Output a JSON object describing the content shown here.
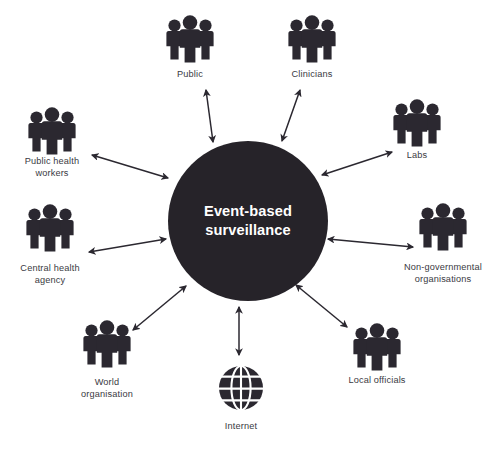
{
  "diagram": {
    "type": "hub-and-spoke",
    "hub": {
      "label_line1": "Event-based",
      "label_line2": "surveillance",
      "fill_color": "#262329",
      "text_color": "#ffffff",
      "cx": 248,
      "cy": 221,
      "r": 80
    },
    "connector_style": {
      "color": "#2b2830",
      "arrowheads": "both",
      "direction": "bidirectional"
    },
    "label_color": "#3a3a3f",
    "nodes": [
      {
        "id": "public",
        "label_lines": [
          "Public"
        ],
        "icon": "people-group-icon",
        "icon_cx": 190,
        "icon_cy": 40,
        "label_x": 190,
        "label_y": 77,
        "spoke_from": [
          206,
          90
        ],
        "spoke_to": [
          213,
          142
        ]
      },
      {
        "id": "clinicians",
        "label_lines": [
          "Clinicians"
        ],
        "icon": "people-group-icon",
        "icon_cx": 312,
        "icon_cy": 40,
        "label_x": 312,
        "label_y": 77,
        "spoke_from": [
          300,
          90
        ],
        "spoke_to": [
          282,
          141
        ]
      },
      {
        "id": "labs",
        "label_lines": [
          "Labs"
        ],
        "icon": "people-group-icon",
        "icon_cx": 417,
        "icon_cy": 124,
        "label_x": 417,
        "label_y": 158,
        "spoke_from": [
          392,
          152
        ],
        "spoke_to": [
          322,
          175
        ]
      },
      {
        "id": "ngo",
        "label_lines": [
          "Non-governmental",
          "organisations"
        ],
        "icon": "people-group-icon",
        "icon_cx": 443,
        "icon_cy": 228,
        "label_x": 443,
        "label_y": 270,
        "spoke_from": [
          413,
          247
        ],
        "spoke_to": [
          328,
          239
        ]
      },
      {
        "id": "local-officials",
        "label_lines": [
          "Local officials"
        ],
        "icon": "people-group-icon",
        "icon_cx": 377,
        "icon_cy": 348,
        "label_x": 377,
        "label_y": 383,
        "spoke_from": [
          347,
          327
        ],
        "spoke_to": [
          296,
          285
        ]
      },
      {
        "id": "internet",
        "label_lines": [
          "Internet"
        ],
        "icon": "globe-icon",
        "icon_cx": 241,
        "icon_cy": 388,
        "label_x": 241,
        "label_y": 429,
        "spoke_from": [
          239,
          355
        ],
        "spoke_to": [
          239,
          307
        ]
      },
      {
        "id": "world-organisation",
        "label_lines": [
          "World",
          "organisation"
        ],
        "icon": "people-group-icon",
        "icon_cx": 107,
        "icon_cy": 345,
        "label_x": 107,
        "label_y": 385,
        "spoke_from": [
          133,
          330
        ],
        "spoke_to": [
          186,
          286
        ]
      },
      {
        "id": "central-health-agency",
        "label_lines": [
          "Central health",
          "agency"
        ],
        "icon": "people-group-icon",
        "icon_cx": 50,
        "icon_cy": 229,
        "label_x": 50,
        "label_y": 271,
        "spoke_from": [
          89,
          252
        ],
        "spoke_to": [
          166,
          239
        ]
      },
      {
        "id": "public-health-workers",
        "label_lines": [
          "Public health",
          "workers"
        ],
        "icon": "people-group-icon",
        "icon_cx": 52,
        "icon_cy": 132,
        "label_x": 52,
        "label_y": 164,
        "spoke_from": [
          92,
          155
        ],
        "spoke_to": [
          168,
          178
        ]
      }
    ]
  }
}
